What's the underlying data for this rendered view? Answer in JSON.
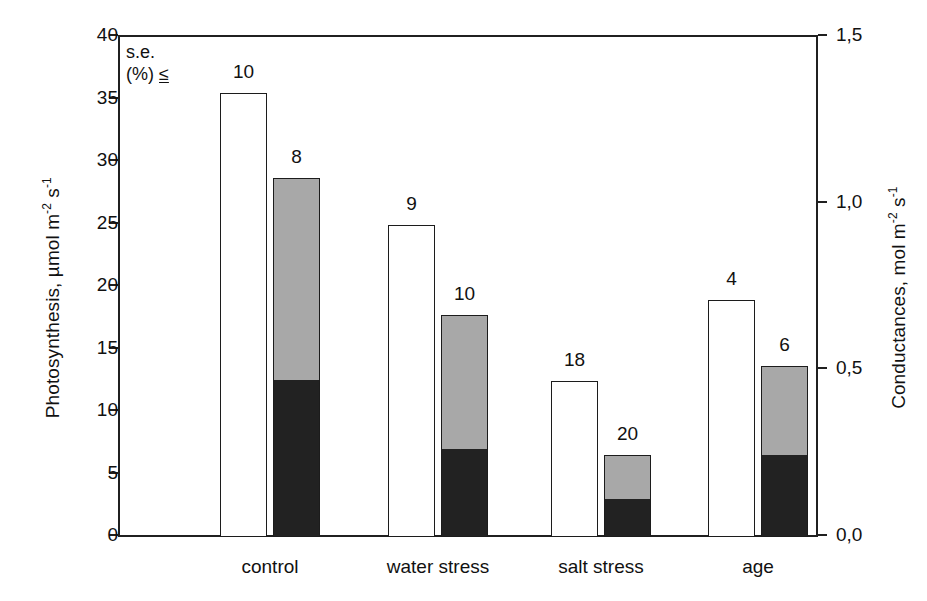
{
  "chart_data": {
    "type": "bar",
    "title": "",
    "subtitle": "",
    "categories": [
      "control",
      "water stress",
      "salt stress",
      "age"
    ],
    "xlabel": "",
    "ylabel": "Photosynthesis, µmol m-2 s-1",
    "y2label": "Conductances, mol m-2 s-1",
    "ylim": [
      0,
      40
    ],
    "y2lim": [
      0.0,
      1.5
    ],
    "yticks": [
      "0",
      "5",
      "10",
      "15",
      "20",
      "25",
      "30",
      "35",
      "40"
    ],
    "ytick_values": [
      0,
      5,
      10,
      15,
      20,
      25,
      30,
      35,
      40
    ],
    "y2ticks": [
      "0,0",
      "0,5",
      "1,0",
      "1,5"
    ],
    "y2tick_values": [
      0.0,
      0.5,
      1.0,
      1.5
    ],
    "grid": false,
    "legend": "none",
    "annotation": {
      "line1": "s.e.",
      "line2_prefix": "(%) ",
      "line2_symbol": "≤"
    },
    "series": [
      {
        "name": "Photosynthesis",
        "style": "open-white-bar",
        "axis": "left",
        "values": [
          35.5,
          25.0,
          12.5,
          19.0
        ],
        "se_labels": [
          "10",
          "9",
          "18",
          "4"
        ]
      },
      {
        "name": "Conductance-upper-grey",
        "style": "grey-segment",
        "axis": "left-scale-stacked",
        "values": [
          28.7,
          17.8,
          6.6,
          13.7
        ],
        "se_labels": [
          "8",
          "10",
          "20",
          "6"
        ]
      },
      {
        "name": "Conductance-lower-black",
        "style": "black-segment",
        "axis": "left-scale-stacked",
        "values": [
          12.5,
          7.0,
          3.0,
          6.5
        ]
      }
    ],
    "bars": [
      {
        "category": "control",
        "open_bar": {
          "value": 35.5,
          "label": "10"
        },
        "stacked_bar": {
          "total": 28.7,
          "black": 12.5,
          "grey_top": 28.7,
          "label": "8"
        }
      },
      {
        "category": "water stress",
        "open_bar": {
          "value": 25.0,
          "label": "9"
        },
        "stacked_bar": {
          "total": 17.8,
          "black": 7.0,
          "grey_top": 17.8,
          "label": "10"
        }
      },
      {
        "category": "salt stress",
        "open_bar": {
          "value": 12.5,
          "label": "18"
        },
        "stacked_bar": {
          "total": 6.6,
          "black": 3.0,
          "grey_top": 6.6,
          "label": "20"
        }
      },
      {
        "category": "age",
        "open_bar": {
          "value": 19.0,
          "label": "4"
        },
        "stacked_bar": {
          "total": 13.7,
          "black": 6.5,
          "grey_top": 13.7,
          "label": "6"
        }
      }
    ],
    "colors": {
      "open_bar_fill": "#ffffff",
      "bar_outline": "#1c1c1c",
      "grey_segment": "#a8a8a8",
      "black_segment": "#222222",
      "axis": "#202020",
      "text": "#111111",
      "background": "#ffffff"
    }
  },
  "axes": {
    "left": {
      "title_main": "Photosynthesis, µmol m",
      "title_sup1": "-2",
      "title_mid": " s",
      "title_sup2": "-1"
    },
    "right": {
      "title_main": "Conductances, mol m",
      "title_sup1": "-2",
      "title_mid": " s",
      "title_sup2": "-1"
    }
  }
}
